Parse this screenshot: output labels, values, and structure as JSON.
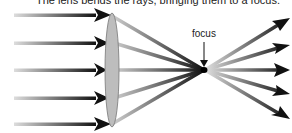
{
  "caption": "The lens bends the rays, bringing them to a focus.",
  "focus_label": "focus",
  "colors": {
    "ray_dark": "#111111",
    "ray_light": "#cccccc",
    "lens_fill": "#bdbdbd",
    "lens_stroke": "#777777"
  },
  "diagram": {
    "incoming_rays_y": [
      15,
      43,
      70,
      98,
      124
    ],
    "lens": {
      "cx": 112,
      "cy": 70,
      "rx": 7,
      "ry": 57
    },
    "focus_point": {
      "x": 204,
      "y": 70
    },
    "outgoing_rays_end_y": [
      20,
      45,
      70,
      93,
      117
    ]
  }
}
